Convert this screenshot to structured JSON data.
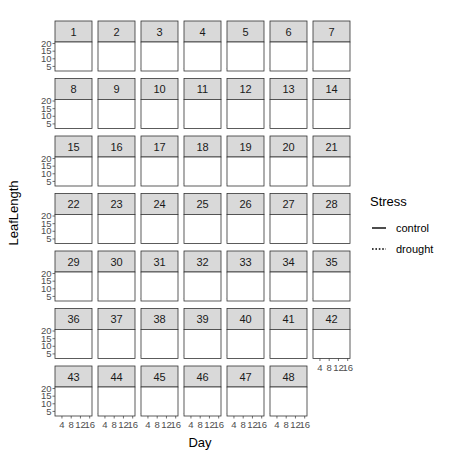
{
  "chart_data": {
    "type": "line",
    "title": "",
    "xlabel": "Day",
    "ylabel": "LeafLength",
    "x_ticks": [
      4,
      8,
      12,
      16
    ],
    "y_ticks": [
      5,
      10,
      15,
      20
    ],
    "xlim": [
      1,
      17
    ],
    "ylim": [
      2,
      21
    ],
    "grid": true,
    "facet_layout": {
      "ncol": 7,
      "nrow": 7
    },
    "legend": {
      "title": "Stress",
      "position": "right",
      "entries": [
        {
          "label": "control",
          "linetype": "solid"
        },
        {
          "label": "drought",
          "linetype": "dotted"
        }
      ]
    },
    "panels": [
      {
        "id": "1",
        "control_plateau": 15,
        "drought_plateau": 11
      },
      {
        "id": "2",
        "control_plateau": 15,
        "drought_plateau": 12
      },
      {
        "id": "3",
        "control_plateau": 14,
        "drought_plateau": 12
      },
      {
        "id": "4",
        "control_plateau": 14,
        "drought_plateau": 12
      },
      {
        "id": "5",
        "control_plateau": 16,
        "drought_plateau": 12
      },
      {
        "id": "6",
        "control_plateau": 15,
        "drought_plateau": 12
      },
      {
        "id": "7",
        "control_plateau": 16,
        "drought_plateau": 13
      },
      {
        "id": "8",
        "control_plateau": 14,
        "drought_plateau": 12
      },
      {
        "id": "9",
        "control_plateau": 13,
        "drought_plateau": 12
      },
      {
        "id": "10",
        "control_plateau": 14,
        "drought_plateau": 12
      },
      {
        "id": "11",
        "control_plateau": 15,
        "drought_plateau": 12
      },
      {
        "id": "12",
        "control_plateau": 15,
        "drought_plateau": 13
      },
      {
        "id": "13",
        "control_plateau": 16,
        "drought_plateau": 12
      },
      {
        "id": "14",
        "control_plateau": 14,
        "drought_plateau": 12
      },
      {
        "id": "15",
        "control_plateau": 16,
        "drought_plateau": 12
      },
      {
        "id": "16",
        "control_plateau": 15,
        "drought_plateau": 12
      },
      {
        "id": "17",
        "control_plateau": 15,
        "drought_plateau": 12
      },
      {
        "id": "18",
        "control_plateau": 14,
        "drought_plateau": 12
      },
      {
        "id": "19",
        "control_plateau": 14,
        "drought_plateau": 12
      },
      {
        "id": "20",
        "control_plateau": 15,
        "drought_plateau": 12
      },
      {
        "id": "21",
        "control_plateau": 15,
        "drought_plateau": 12
      },
      {
        "id": "22",
        "control_plateau": 14,
        "drought_plateau": 12
      },
      {
        "id": "23",
        "control_plateau": 13,
        "drought_plateau": 12
      },
      {
        "id": "24",
        "control_plateau": 14,
        "drought_plateau": 12
      },
      {
        "id": "25",
        "control_plateau": 13,
        "drought_plateau": 12
      },
      {
        "id": "26",
        "control_plateau": 14,
        "drought_plateau": 12
      },
      {
        "id": "27",
        "control_plateau": 15,
        "drought_plateau": 12
      },
      {
        "id": "28",
        "control_plateau": 17,
        "drought_plateau": 13
      },
      {
        "id": "29",
        "control_plateau": 14,
        "drought_plateau": 12
      },
      {
        "id": "30",
        "control_plateau": 13,
        "drought_plateau": 12
      },
      {
        "id": "31",
        "control_plateau": 16,
        "drought_plateau": 12
      },
      {
        "id": "32",
        "control_plateau": 14,
        "drought_plateau": 12
      },
      {
        "id": "33",
        "control_plateau": 14,
        "drought_plateau": 12
      },
      {
        "id": "34",
        "control_plateau": 14,
        "drought_plateau": 12
      },
      {
        "id": "35",
        "control_plateau": 14,
        "drought_plateau": 12
      },
      {
        "id": "36",
        "control_plateau": 13,
        "drought_plateau": 12
      },
      {
        "id": "37",
        "control_plateau": 13,
        "drought_plateau": 12
      },
      {
        "id": "38",
        "control_plateau": 14,
        "drought_plateau": 12
      },
      {
        "id": "39",
        "control_plateau": 15,
        "drought_plateau": 12
      },
      {
        "id": "40",
        "control_plateau": 14,
        "drought_plateau": 12
      },
      {
        "id": "41",
        "control_plateau": 14,
        "drought_plateau": 12
      },
      {
        "id": "42",
        "control_plateau": 12,
        "drought_plateau": 12
      },
      {
        "id": "43",
        "control_plateau": 12,
        "drought_plateau": 11
      },
      {
        "id": "44",
        "control_plateau": 13,
        "drought_plateau": 11
      },
      {
        "id": "45",
        "control_plateau": 15,
        "drought_plateau": 12
      },
      {
        "id": "46",
        "control_plateau": 14,
        "drought_plateau": 10
      },
      {
        "id": "47",
        "control_plateau": 15,
        "drought_plateau": 12
      },
      {
        "id": "48",
        "control_plateau": 13,
        "drought_plateau": 11
      }
    ]
  },
  "labels": {
    "xlabel": "Day",
    "ylabel": "LeafLength",
    "legend_title": "Stress",
    "legend_control": "control",
    "legend_drought": "drought"
  }
}
